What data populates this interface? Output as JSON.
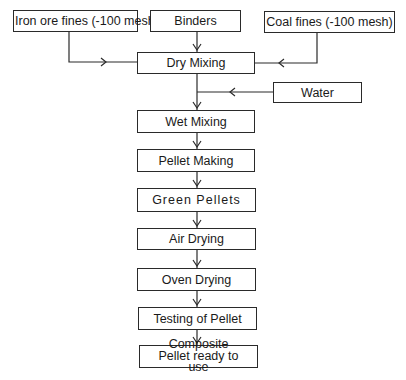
{
  "flowchart": {
    "inputs": {
      "iron_ore": "Iron ore fines (-100 mesh)",
      "binders": "Binders",
      "coal": "Coal fines (-100 mesh)",
      "water": "Water"
    },
    "steps": [
      "Dry Mixing",
      "Wet Mixing",
      "Pellet Making",
      "Green Pellets",
      "Air Drying",
      "Oven Drying",
      "Testing of Pellet",
      "Composite Pellet ready to use"
    ]
  }
}
